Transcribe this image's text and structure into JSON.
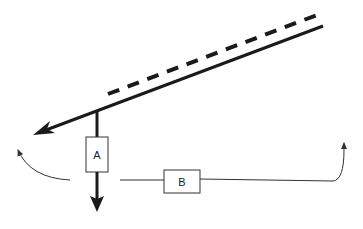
{
  "diagram": {
    "colors": {
      "stroke": "#1a1a1a",
      "thin": "#333333",
      "background": "#ffffff"
    },
    "boxes": [
      {
        "id": "A",
        "label": "A"
      },
      {
        "id": "B",
        "label": "B"
      }
    ],
    "lines": {
      "solid_main": "solid thick line with arrowhead pointing lower-left",
      "dashed_parallel": "dashed line parallel above main line",
      "vertical_down": "vertical thick arrow through box A pointing down",
      "curved_left": "thin curved arrow pointing up-left",
      "horizontal_b": "thin line through box B curving up to arrow at right"
    }
  }
}
